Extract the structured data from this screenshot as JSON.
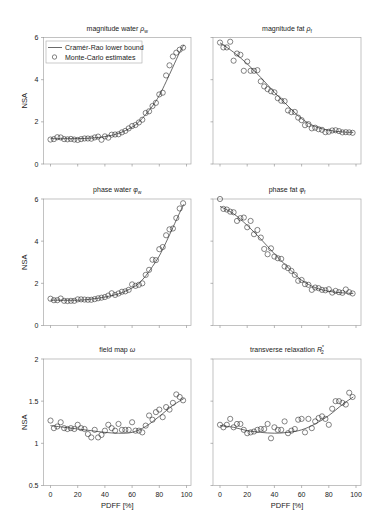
{
  "figure": {
    "legend": [
      {
        "label": "Cramér-Rao lower bound",
        "marker": "line"
      },
      {
        "label": "Monte-Carlo estimates",
        "marker": "open-circle"
      }
    ],
    "ylabel": "NSA",
    "xlabel": "PDFF [%]"
  },
  "chart_data": [
    {
      "type": "line",
      "title": "magnitude water ",
      "symbol": "ρ",
      "sub": "w",
      "sup": "",
      "xlabel": "",
      "ylabel": "NSA",
      "xlim": [
        0,
        100
      ],
      "ylim": [
        0,
        6
      ],
      "xticks": [
        0,
        20,
        40,
        60,
        80,
        100
      ],
      "show_xtick_labels": false,
      "yticks": [
        0,
        2,
        4,
        6
      ],
      "show_ytick_labels": true,
      "grid": false,
      "legend_position": "upper left",
      "series": [
        {
          "name": "Cramér-Rao lower bound",
          "type": "line",
          "x": [
            0,
            10,
            20,
            30,
            40,
            50,
            60,
            65,
            70,
            75,
            80,
            85,
            90,
            95,
            98
          ],
          "y": [
            1.2,
            1.2,
            1.2,
            1.23,
            1.3,
            1.45,
            1.75,
            2.0,
            2.35,
            2.75,
            3.25,
            3.9,
            4.6,
            5.3,
            5.65
          ]
        },
        {
          "name": "Monte-Carlo estimates",
          "type": "scatter",
          "x": [
            0,
            2.5,
            5,
            7.5,
            10,
            12.5,
            15,
            17.5,
            20,
            22.5,
            25,
            27.5,
            30,
            32.5,
            35,
            37.5,
            40,
            42.5,
            45,
            47.5,
            50,
            52.5,
            55,
            57.5,
            60,
            62.5,
            65,
            67.5,
            70,
            72.5,
            75,
            77.5,
            80,
            82.5,
            85,
            87.5,
            90,
            92.5,
            95,
            97.5
          ],
          "y": [
            1.16,
            1.18,
            1.27,
            1.26,
            1.18,
            1.17,
            1.19,
            1.16,
            1.14,
            1.18,
            1.21,
            1.21,
            1.2,
            1.26,
            1.3,
            1.15,
            1.31,
            1.25,
            1.39,
            1.4,
            1.41,
            1.5,
            1.57,
            1.69,
            1.8,
            1.85,
            1.97,
            2.1,
            2.42,
            2.5,
            2.75,
            2.9,
            3.3,
            3.38,
            4.2,
            4.68,
            5.1,
            5.28,
            5.42,
            5.52
          ]
        }
      ]
    },
    {
      "type": "line",
      "title": "magnitude fat ",
      "symbol": "ρ",
      "sub": "f",
      "sup": "",
      "xlabel": "",
      "ylabel": "",
      "xlim": [
        0,
        100
      ],
      "ylim": [
        0,
        6
      ],
      "xticks": [
        0,
        20,
        40,
        60,
        80,
        100
      ],
      "show_xtick_labels": false,
      "yticks": [
        0,
        2,
        4,
        6
      ],
      "show_ytick_labels": false,
      "grid": false,
      "series": [
        {
          "name": "Cramér-Rao lower bound",
          "type": "line",
          "x": [
            0,
            10,
            20,
            30,
            40,
            50,
            60,
            70,
            80,
            90,
            98
          ],
          "y": [
            5.75,
            5.3,
            4.75,
            4.1,
            3.4,
            2.75,
            2.15,
            1.78,
            1.6,
            1.52,
            1.5
          ]
        },
        {
          "name": "Monte-Carlo estimates",
          "type": "scatter",
          "x": [
            0,
            2.5,
            5,
            7.5,
            10,
            12.5,
            15,
            17.5,
            20,
            22.5,
            25,
            27.5,
            30,
            32.5,
            35,
            37.5,
            40,
            42.5,
            45,
            47.5,
            50,
            52.5,
            55,
            57.5,
            60,
            62.5,
            65,
            67.5,
            70,
            72.5,
            75,
            77.5,
            80,
            82.5,
            85,
            87.5,
            90,
            92.5,
            95,
            97.5
          ],
          "y": [
            5.76,
            5.53,
            5.53,
            5.8,
            4.9,
            5.24,
            5.18,
            4.42,
            4.86,
            4.42,
            4.42,
            4.45,
            3.92,
            3.68,
            3.55,
            3.45,
            3.4,
            3.12,
            3.0,
            2.98,
            2.54,
            2.46,
            2.47,
            2.2,
            2.08,
            1.84,
            1.89,
            1.69,
            1.72,
            1.65,
            1.62,
            1.51,
            1.53,
            1.59,
            1.6,
            1.56,
            1.5,
            1.51,
            1.5,
            1.48
          ]
        }
      ]
    },
    {
      "type": "line",
      "title": "phase water ",
      "symbol": "φ",
      "sub": "w",
      "sup": "",
      "xlabel": "",
      "ylabel": "NSA",
      "xlim": [
        0,
        100
      ],
      "ylim": [
        0,
        6
      ],
      "xticks": [
        0,
        20,
        40,
        60,
        80,
        100
      ],
      "show_xtick_labels": false,
      "yticks": [
        0,
        2,
        4,
        6
      ],
      "show_ytick_labels": true,
      "grid": false,
      "series": [
        {
          "name": "Cramér-Rao lower bound",
          "type": "line",
          "x": [
            0,
            10,
            20,
            30,
            40,
            50,
            60,
            65,
            70,
            75,
            80,
            85,
            90,
            95,
            98
          ],
          "y": [
            1.2,
            1.2,
            1.2,
            1.25,
            1.35,
            1.5,
            1.78,
            2.0,
            2.35,
            2.8,
            3.3,
            3.95,
            4.65,
            5.35,
            5.75
          ]
        },
        {
          "name": "Monte-Carlo estimates",
          "type": "scatter",
          "x": [
            0,
            2.5,
            5,
            7.5,
            10,
            12.5,
            15,
            17.5,
            20,
            22.5,
            25,
            27.5,
            30,
            32.5,
            35,
            37.5,
            40,
            42.5,
            45,
            47.5,
            50,
            52.5,
            55,
            57.5,
            60,
            62.5,
            65,
            67.5,
            70,
            72.5,
            75,
            77.5,
            80,
            82.5,
            85,
            87.5,
            90,
            92.5,
            95,
            97.5
          ],
          "y": [
            1.27,
            1.2,
            1.2,
            1.28,
            1.17,
            1.16,
            1.17,
            1.17,
            1.24,
            1.24,
            1.23,
            1.22,
            1.22,
            1.25,
            1.29,
            1.32,
            1.35,
            1.42,
            1.53,
            1.45,
            1.52,
            1.6,
            1.62,
            1.69,
            1.95,
            1.88,
            1.93,
            2.0,
            2.4,
            2.64,
            3.12,
            3.1,
            3.62,
            3.72,
            4.28,
            4.56,
            4.6,
            5.1,
            5.55,
            5.8
          ]
        }
      ]
    },
    {
      "type": "line",
      "title": "phase fat ",
      "symbol": "φ",
      "sub": "f",
      "sup": "",
      "xlabel": "",
      "ylabel": "",
      "xlim": [
        0,
        100
      ],
      "ylim": [
        0,
        6
      ],
      "xticks": [
        0,
        20,
        40,
        60,
        80,
        100
      ],
      "show_xtick_labels": false,
      "yticks": [
        0,
        2,
        4,
        6
      ],
      "show_ytick_labels": false,
      "grid": false,
      "series": [
        {
          "name": "Cramér-Rao lower bound",
          "type": "line",
          "x": [
            0,
            10,
            20,
            30,
            40,
            50,
            60,
            70,
            80,
            90,
            98
          ],
          "y": [
            5.65,
            5.3,
            4.75,
            4.1,
            3.4,
            2.75,
            2.15,
            1.8,
            1.62,
            1.55,
            1.52
          ]
        },
        {
          "name": "Monte-Carlo estimates",
          "type": "scatter",
          "x": [
            0,
            2.5,
            5,
            7.5,
            10,
            12.5,
            15,
            17.5,
            20,
            22.5,
            25,
            27.5,
            30,
            32.5,
            35,
            37.5,
            40,
            42.5,
            45,
            47.5,
            50,
            52.5,
            55,
            57.5,
            60,
            62.5,
            65,
            67.5,
            70,
            72.5,
            75,
            77.5,
            80,
            82.5,
            85,
            87.5,
            90,
            92.5,
            95,
            97.5
          ],
          "y": [
            6.0,
            5.53,
            5.5,
            5.4,
            5.37,
            4.96,
            5.09,
            5.12,
            4.66,
            4.96,
            4.33,
            4.53,
            4.17,
            3.63,
            3.38,
            3.66,
            3.27,
            3.19,
            3.16,
            2.8,
            2.72,
            2.59,
            2.4,
            2.12,
            2.16,
            1.96,
            1.93,
            1.69,
            1.8,
            1.77,
            1.69,
            1.67,
            1.72,
            1.56,
            1.64,
            1.58,
            1.55,
            1.71,
            1.58,
            1.52
          ]
        }
      ]
    },
    {
      "type": "line",
      "title": "field map ",
      "symbol": "ω",
      "sub": "",
      "sup": "",
      "xlabel": "PDFF [%]",
      "ylabel": "NSA",
      "xlim": [
        0,
        100
      ],
      "ylim": [
        0.5,
        2
      ],
      "xticks": [
        0,
        20,
        40,
        60,
        80,
        100
      ],
      "show_xtick_labels": true,
      "yticks": [
        0.5,
        1,
        1.5,
        2
      ],
      "show_ytick_labels": true,
      "grid": false,
      "series": [
        {
          "name": "Cramér-Rao lower bound",
          "type": "line",
          "x": [
            0,
            10,
            20,
            30,
            40,
            50,
            60,
            70,
            80,
            90,
            98
          ],
          "y": [
            1.21,
            1.19,
            1.17,
            1.15,
            1.13,
            1.12,
            1.13,
            1.2,
            1.32,
            1.45,
            1.53
          ]
        },
        {
          "name": "Monte-Carlo estimates",
          "type": "scatter",
          "x": [
            0,
            2.5,
            5,
            7.5,
            10,
            12.5,
            15,
            17.5,
            20,
            22.5,
            25,
            27.5,
            30,
            32.5,
            35,
            37.5,
            40,
            42.5,
            45,
            47.5,
            50,
            52.5,
            55,
            57.5,
            60,
            62.5,
            65,
            67.5,
            70,
            72.5,
            75,
            77.5,
            80,
            82.5,
            85,
            87.5,
            90,
            92.5,
            95,
            97.5
          ],
          "y": [
            1.27,
            1.18,
            1.2,
            1.25,
            1.18,
            1.17,
            1.18,
            1.17,
            1.22,
            1.18,
            1.17,
            1.11,
            1.07,
            1.16,
            1.07,
            1.1,
            1.15,
            1.22,
            1.18,
            1.15,
            1.23,
            1.16,
            1.16,
            1.16,
            1.25,
            1.15,
            1.15,
            1.13,
            1.21,
            1.33,
            1.28,
            1.37,
            1.4,
            1.31,
            1.43,
            1.4,
            1.48,
            1.58,
            1.55,
            1.51
          ]
        }
      ]
    },
    {
      "type": "line",
      "title": "transverse relaxation ",
      "symbol": "R",
      "sub": "2",
      "sup": "*",
      "xlabel": "PDFF [%]",
      "ylabel": "",
      "xlim": [
        0,
        100
      ],
      "ylim": [
        0.5,
        2
      ],
      "xticks": [
        0,
        20,
        40,
        60,
        80,
        100
      ],
      "show_xtick_labels": true,
      "yticks": [
        0.5,
        1,
        1.5,
        2
      ],
      "show_ytick_labels": false,
      "grid": false,
      "series": [
        {
          "name": "Cramér-Rao lower bound",
          "type": "line",
          "x": [
            0,
            10,
            20,
            30,
            40,
            50,
            60,
            70,
            80,
            90,
            98
          ],
          "y": [
            1.21,
            1.19,
            1.15,
            1.13,
            1.12,
            1.13,
            1.16,
            1.23,
            1.33,
            1.46,
            1.55
          ]
        },
        {
          "name": "Monte-Carlo estimates",
          "type": "scatter",
          "x": [
            0,
            2.5,
            5,
            7.5,
            10,
            12.5,
            15,
            17.5,
            20,
            22.5,
            25,
            27.5,
            30,
            32.5,
            35,
            37.5,
            40,
            42.5,
            45,
            47.5,
            50,
            52.5,
            55,
            57.5,
            60,
            62.5,
            65,
            67.5,
            70,
            72.5,
            75,
            77.5,
            80,
            82.5,
            85,
            87.5,
            90,
            92.5,
            95,
            97.5
          ],
          "y": [
            1.22,
            1.19,
            1.22,
            1.29,
            1.19,
            1.23,
            1.23,
            1.16,
            1.12,
            1.13,
            1.14,
            1.16,
            1.17,
            1.17,
            1.23,
            1.06,
            1.19,
            1.16,
            1.16,
            1.26,
            1.12,
            1.15,
            1.17,
            1.28,
            1.29,
            1.13,
            1.29,
            1.18,
            1.26,
            1.3,
            1.32,
            1.29,
            1.22,
            1.41,
            1.5,
            1.5,
            1.48,
            1.46,
            1.6,
            1.55
          ]
        }
      ]
    }
  ]
}
